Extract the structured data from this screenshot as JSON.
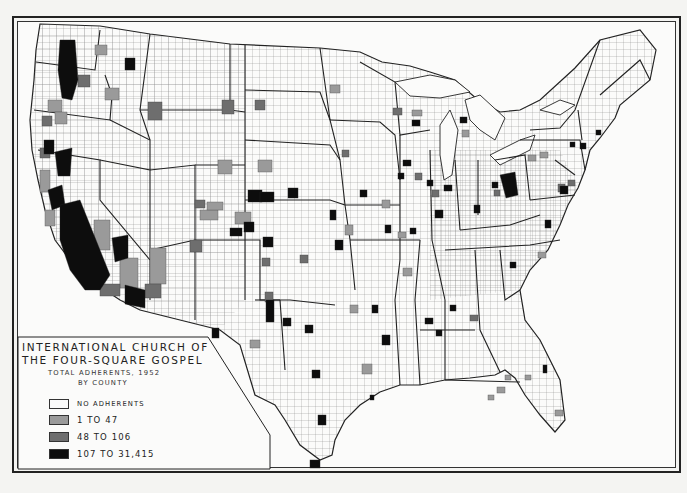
{
  "map": {
    "title_line1": "INTERNATIONAL CHURCH OF",
    "title_line2": "THE FOUR-SQUARE GOSPEL",
    "subtitle_line1": "TOTAL ADHERENTS, 1952",
    "subtitle_line2": "BY COUNTY",
    "region": "Conterminous United States, county boundaries",
    "legend": [
      {
        "label": "NO ADHERENTS",
        "color": "#fafafa"
      },
      {
        "label": "1 TO 47",
        "color": "#9a9a9a"
      },
      {
        "label": "48 TO 106",
        "color": "#6e6e6e"
      },
      {
        "label": "107 TO 31,415",
        "color": "#0d0d0d"
      }
    ],
    "colors": {
      "background": "#f4f4f2",
      "frame": "#222222",
      "county_lines": "#555555",
      "state_lines": "#222222"
    }
  }
}
